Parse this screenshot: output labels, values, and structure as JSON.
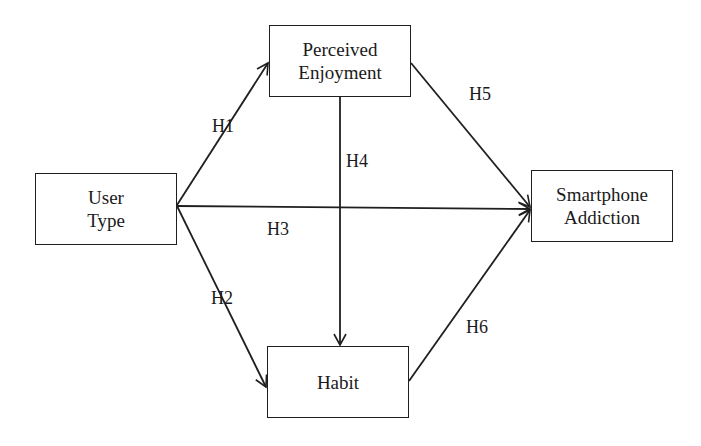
{
  "nodes": {
    "user_type": {
      "line1": "User",
      "line2": "Type"
    },
    "perceived_enjoyment": {
      "line1": "Perceived",
      "line2": "Enjoyment"
    },
    "smartphone_addiction": {
      "line1": "Smartphone",
      "line2": "Addiction"
    },
    "habit": {
      "line1": "Habit"
    }
  },
  "edges": [
    {
      "id": "H1",
      "label": "H1",
      "from": "User Type",
      "to": "Perceived Enjoyment"
    },
    {
      "id": "H2",
      "label": "H2",
      "from": "User Type",
      "to": "Habit"
    },
    {
      "id": "H3",
      "label": "H3",
      "from": "User Type",
      "to": "Smartphone Addiction"
    },
    {
      "id": "H4",
      "label": "H4",
      "from": "Perceived Enjoyment",
      "to": "Habit"
    },
    {
      "id": "H5",
      "label": "H5",
      "from": "Perceived Enjoyment",
      "to": "Smartphone Addiction"
    },
    {
      "id": "H6",
      "label": "H6",
      "from": "Habit",
      "to": "Smartphone Addiction"
    }
  ],
  "colors": {
    "line": "#1f1f1f",
    "background": "#ffffff"
  }
}
